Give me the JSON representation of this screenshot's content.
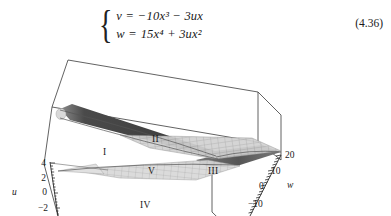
{
  "equation": {
    "brace": "{",
    "line1": {
      "lhs": "v",
      "eq": "=",
      "rhs": "−10x³ − 3ux"
    },
    "line2": {
      "lhs": "w",
      "eq": "=",
      "rhs": "15x⁴ + 3ux²"
    },
    "number": "(4.36)"
  },
  "figure": {
    "axes": {
      "u": {
        "name": "u",
        "ticks": [
          "4",
          "2",
          "0",
          "−2"
        ]
      },
      "w": {
        "name": "w",
        "ticks": [
          "20",
          "10",
          "0",
          "−10"
        ]
      }
    },
    "regions": [
      {
        "id": "region-1",
        "label": "I"
      },
      {
        "id": "region-2",
        "label": "II"
      },
      {
        "id": "region-3",
        "label": "III"
      },
      {
        "id": "region-4",
        "label": "IV"
      },
      {
        "id": "region-5",
        "label": "V"
      }
    ],
    "colors": {
      "wireframe": "#3a3a3a",
      "dark_surface": "#4f4f4f",
      "mesh_surface": "#bfbfbf",
      "mesh_grid": "#8a8a8a",
      "background": "#ffffff"
    }
  }
}
